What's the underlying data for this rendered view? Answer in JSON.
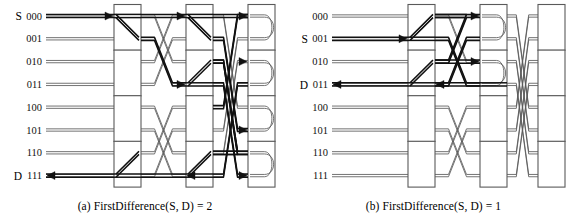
{
  "figure": {
    "background": "#ffffff",
    "line_color": "#5a5a5a",
    "bold_color": "#111111",
    "box_fill": "#ffffff",
    "box_stroke": "#5a5a5a"
  },
  "panels": [
    {
      "id": "a",
      "caption": "(a) FirstDifference(S, D) = 2",
      "source_label": "S",
      "dest_label": "D",
      "source_row": "000",
      "dest_row": "111",
      "row_labels": [
        "000",
        "001",
        "010",
        "011",
        "100",
        "101",
        "110",
        "111"
      ],
      "source_index": 0,
      "dest_index": 7,
      "stages": 3,
      "loopback_stage": 3,
      "switch_diagonal_rows": [
        0,
        3
      ],
      "arc_rows": [
        0,
        1,
        2,
        3
      ]
    },
    {
      "id": "b",
      "caption": "(b) FirstDifference(S, D) = 1",
      "source_label": "S",
      "dest_label": "D",
      "source_row": "001",
      "dest_row": "011",
      "row_labels": [
        "000",
        "001",
        "010",
        "011",
        "100",
        "101",
        "110",
        "111"
      ],
      "source_index": 1,
      "dest_index": 3,
      "stages": 3,
      "loopback_stage": 2,
      "switch_diagonal_rows": [
        0,
        1
      ],
      "arc_rows": [
        0,
        1
      ]
    }
  ],
  "chart_data": {
    "type": "diagram",
    "node_count": 8,
    "stage_count": 3,
    "address_bits": 3,
    "panels": [
      {
        "id": "a",
        "first_difference": 2,
        "source": "000",
        "destination": "111",
        "path_description": "S=000 forward through stage1, stage2, loop back at stage3, return to D=111"
      },
      {
        "id": "b",
        "first_difference": 1,
        "source": "001",
        "destination": "011",
        "path_description": "S=001 forward through stage1, loop back at stage2, return to D=011"
      }
    ]
  }
}
